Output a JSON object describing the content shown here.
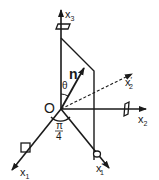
{
  "diagram": {
    "labels": {
      "x3": "x",
      "x3_sub": "3",
      "x2": "x",
      "x2_sub": "2",
      "x2_prime": "x",
      "x2_prime_sub": "2",
      "x2_prime_mark": "′",
      "x1": "x",
      "x1_sub": "1",
      "x1_prime": "x",
      "x1_prime_sub": "1",
      "x1_prime_mark": "′",
      "origin": "O",
      "normal": "n",
      "theta": "θ",
      "angle_num": "π",
      "angle_den": "4"
    },
    "colors": {
      "ink": "#1a1a1a",
      "background": "#ffffff"
    }
  }
}
